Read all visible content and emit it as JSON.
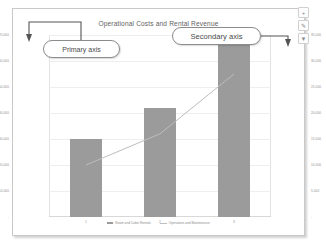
{
  "chart_data": {
    "type": "bar",
    "title": "Operational Costs and Rental Revenue",
    "xlabel": "",
    "ylabel": "",
    "grid": true,
    "legend_position": "bottom",
    "categories": [
      "1",
      "2",
      "3"
    ],
    "series": [
      {
        "name": "Room and Cabin Rentals",
        "type": "bar",
        "axis": "secondary",
        "values": [
          15000,
          21000,
          33500
        ],
        "color": "#9b9b9b"
      },
      {
        "name": "Operations and Maintenance",
        "type": "line",
        "axis": "primary",
        "values": [
          20000,
          32000,
          55000
        ],
        "color": "#bdbdbd"
      }
    ],
    "primary_axis": {
      "position": "left",
      "ticks": [
        "$70,000",
        "$60,000",
        "$50,000",
        "$40,000",
        "$30,000",
        "$20,000",
        "$10,000",
        "-"
      ],
      "ylim": [
        0,
        70000
      ]
    },
    "secondary_axis": {
      "position": "right",
      "ticks": [
        "35,000",
        "30,000",
        "25,000",
        "20,000",
        "15,000",
        "10,000",
        "5,000",
        "-"
      ],
      "ylim": [
        0,
        35000
      ]
    }
  },
  "annotations": {
    "primary_callout": "Primary axis",
    "secondary_callout": "Secondary axis"
  },
  "chart_buttons": [
    {
      "name": "chart-elements-button",
      "glyph": "+"
    },
    {
      "name": "chart-styles-button",
      "glyph": "✎"
    },
    {
      "name": "chart-filters-button",
      "glyph": "▼"
    }
  ]
}
